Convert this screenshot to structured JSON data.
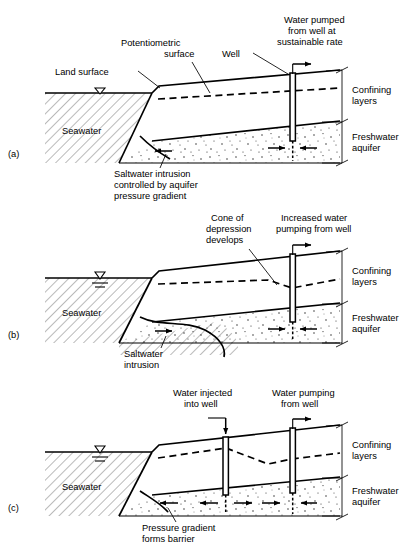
{
  "figure": {
    "background": "#ffffff",
    "ink": "#000000"
  },
  "common_labels": {
    "seawater": "Seawater",
    "confining_layers": "Confining\nlayers",
    "confining_layers_line1": "Confining",
    "confining_layers_line2": "layers",
    "freshwater_aquifer_line1": "Freshwater",
    "freshwater_aquifer_line2": "aquifer"
  },
  "panels": [
    {
      "id": "a",
      "id_label": "(a)",
      "callouts": [
        {
          "name": "land-surface",
          "lines": [
            "Land surface"
          ]
        },
        {
          "name": "potentiometric-surface",
          "lines": [
            "Potentiometric",
            "surface"
          ]
        },
        {
          "name": "well",
          "lines": [
            "Well"
          ]
        },
        {
          "name": "water-pumped",
          "lines": [
            "Water pumped",
            "from well at",
            "sustainable rate"
          ]
        },
        {
          "name": "saltwater-intrusion-note",
          "lines": [
            "Saltwater intrusion",
            "controlled by aquifer",
            "pressure gradient"
          ]
        }
      ],
      "region_labels": {
        "seawater": "Seawater",
        "confining": [
          "Confining",
          "layers"
        ],
        "aquifer": [
          "Freshwater",
          "aquifer"
        ]
      },
      "wells": [
        {
          "name": "pumping-well",
          "action": "pumping",
          "arrow": "right"
        }
      ]
    },
    {
      "id": "b",
      "id_label": "(b)",
      "callouts": [
        {
          "name": "cone-of-depression",
          "lines": [
            "Cone of",
            "depression",
            "develops"
          ]
        },
        {
          "name": "increased-pumping",
          "lines": [
            "Increased water",
            "pumping from well"
          ]
        },
        {
          "name": "saltwater-intrusion-note",
          "lines": [
            "Saltwater",
            "intrusion"
          ]
        }
      ],
      "region_labels": {
        "seawater": "Seawater",
        "confining": [
          "Confining",
          "layers"
        ],
        "aquifer": [
          "Freshwater",
          "aquifer"
        ]
      },
      "wells": [
        {
          "name": "pumping-well",
          "action": "pumping",
          "arrow": "right"
        }
      ]
    },
    {
      "id": "c",
      "id_label": "(c)",
      "callouts": [
        {
          "name": "water-injected",
          "lines": [
            "Water injected",
            "into well"
          ]
        },
        {
          "name": "water-pumping",
          "lines": [
            "Water pumping",
            "from well"
          ]
        },
        {
          "name": "pressure-gradient-note",
          "lines": [
            "Pressure gradient",
            "forms barrier"
          ]
        }
      ],
      "region_labels": {
        "seawater": "Seawater",
        "confining": [
          "Confining",
          "layers"
        ],
        "aquifer": [
          "Freshwater",
          "aquifer"
        ]
      },
      "wells": [
        {
          "name": "injection-well",
          "action": "injection",
          "arrow": "down"
        },
        {
          "name": "pumping-well",
          "action": "pumping",
          "arrow": "right"
        }
      ]
    }
  ]
}
